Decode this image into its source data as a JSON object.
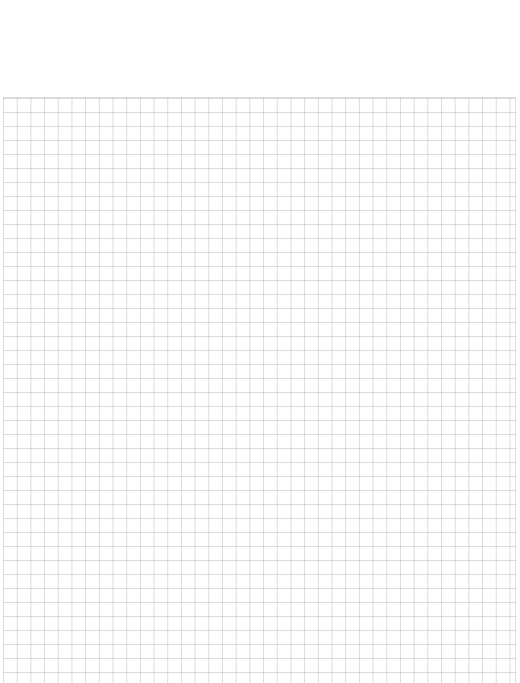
{
  "page": {
    "background_color": "#ffffff",
    "grid_line_color": "#bebebe",
    "grid": {
      "left_px": 3,
      "top_px": 97,
      "cell_width_px": 13.7,
      "cell_height_px": 14,
      "columns": 37,
      "rows": 42
    }
  }
}
